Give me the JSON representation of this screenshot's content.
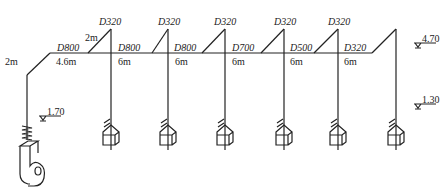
{
  "diagram": {
    "type": "ventilation-duct-system-schematic",
    "line_color": "#222222",
    "main_duct": [
      {
        "diameter": "D800",
        "length": "4.6m"
      },
      {
        "diameter": "D800",
        "length": "6m"
      },
      {
        "diameter": "D800",
        "length": "6m"
      },
      {
        "diameter": "D700",
        "length": "6m"
      },
      {
        "diameter": "D500",
        "length": "6m"
      },
      {
        "diameter": "D320",
        "length": "6m"
      }
    ],
    "riser_length": "2m",
    "branch_length": "2m",
    "branches": [
      {
        "diameter": "D320"
      },
      {
        "diameter": "D320"
      },
      {
        "diameter": "D320"
      },
      {
        "diameter": "D320"
      },
      {
        "diameter": "D320"
      }
    ],
    "elevations": {
      "fan": "1.70",
      "top": "4.70",
      "hoods": "1.30"
    },
    "components": {
      "fan": "centrifugal-fan",
      "hood_count": 6
    }
  }
}
